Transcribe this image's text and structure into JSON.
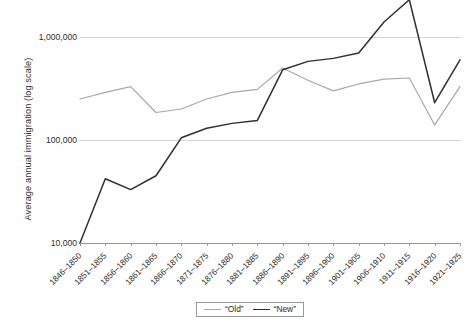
{
  "chart_data": {
    "type": "line",
    "title": "",
    "xlabel": "",
    "ylabel": "Average annual immigration (log scale)",
    "y_scale": "log",
    "ylim": [
      10000,
      1000000
    ],
    "y_ticks": [
      10000,
      100000,
      1000000
    ],
    "y_tick_labels": [
      "10,000",
      "100,000",
      "1,000,000"
    ],
    "grid": true,
    "legend_position": "bottom-center",
    "categories": [
      "1846–1850",
      "1851–1855",
      "1856–1860",
      "1861–1865",
      "1866–1870",
      "1871–1875",
      "1876–1880",
      "1881–1885",
      "1886–1890",
      "1891–1895",
      "1896–1900",
      "1901–1905",
      "1906–1910",
      "1911–1915",
      "1916–1920",
      "1921–1925"
    ],
    "series": [
      {
        "name": "“Old”",
        "color": "#a8a8a8",
        "values": [
          250000,
          290000,
          330000,
          185000,
          200000,
          250000,
          290000,
          310000,
          500000,
          380000,
          300000,
          350000,
          390000,
          400000,
          140000,
          330000
        ]
      },
      {
        "name": "“New”",
        "color": "#2f2f2f",
        "values": [
          10000,
          42000,
          33000,
          45000,
          105000,
          130000,
          145000,
          155000,
          480000,
          580000,
          620000,
          700000,
          1400000,
          2300000,
          230000,
          600000
        ]
      }
    ]
  },
  "legend": {
    "entries": [
      {
        "label": "“Old”"
      },
      {
        "label": "“New”"
      }
    ]
  }
}
